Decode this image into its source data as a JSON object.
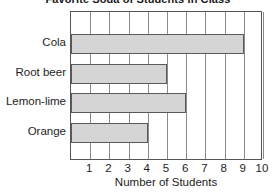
{
  "chart_data": {
    "type": "bar",
    "orientation": "horizontal",
    "title": "Favorite Soda of Students in Class",
    "xlabel": "Number of Students",
    "ylabel": "",
    "categories": [
      "Cola",
      "Root beer",
      "Lemon-lime",
      "Orange"
    ],
    "values": [
      9,
      5,
      6,
      4
    ],
    "xlim": [
      0,
      10
    ],
    "xticks": [
      "1",
      "2",
      "3",
      "4",
      "5",
      "6",
      "7",
      "8",
      "9",
      "10"
    ],
    "grid": "vertical",
    "legend": "none",
    "colors": {
      "bar_fill": "#d5d5d5",
      "bar_border": "#5a5a5a",
      "frame": "#555555",
      "gridline": "#8a8a8a",
      "text": "#1d1d1d",
      "background": "#ffffff"
    }
  }
}
